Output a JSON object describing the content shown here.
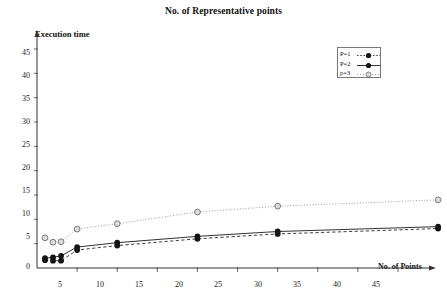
{
  "chart_data": {
    "type": "line",
    "title": "No. of Representative points",
    "xlabel": "No. of  Points",
    "ylabel": "Execution time",
    "xlim": [
      0,
      50
    ],
    "ylim": [
      0,
      47
    ],
    "xticks": [
      5,
      10,
      15,
      20,
      25,
      30,
      35,
      40,
      45
    ],
    "yticks": [
      0,
      5,
      10,
      15,
      20,
      25,
      30,
      35,
      40,
      45
    ],
    "grid": false,
    "legend_position": "upper-right",
    "series": [
      {
        "name": "P=1",
        "marker": "filled-circle",
        "linestyle": "solid",
        "color": "#1a1a1a",
        "x": [
          1,
          2,
          3,
          5,
          10,
          20,
          30,
          50
        ],
        "y": [
          2.0,
          2.2,
          2.5,
          4.3,
          5.2,
          6.5,
          7.5,
          8.5
        ]
      },
      {
        "name": "P=2",
        "marker": "filled-circle",
        "linestyle": "dashed",
        "color": "#1a1a1a",
        "x": [
          1,
          2,
          3,
          5,
          10,
          20,
          30,
          50
        ],
        "y": [
          1.6,
          1.5,
          1.5,
          3.7,
          4.6,
          6.0,
          7.0,
          8.1
        ]
      },
      {
        "name": "p=3",
        "marker": "open-circle",
        "linestyle": "dotted",
        "color": "#8a8a8a",
        "x": [
          1,
          2,
          3,
          5,
          10,
          20,
          30,
          50
        ],
        "y": [
          6.2,
          5.3,
          5.4,
          8.0,
          9.1,
          11.5,
          12.7,
          14.0
        ]
      }
    ]
  },
  "legend": {
    "entries": [
      {
        "label": "P=1"
      },
      {
        "label": "P=2"
      },
      {
        "label": "p=3"
      }
    ]
  },
  "ytick_labels": [
    "45",
    "40",
    "35",
    "30",
    "25",
    "20",
    "15",
    "10",
    "5",
    "0"
  ],
  "xtick_labels": [
    "5",
    "10",
    "15",
    "20",
    "25",
    "30",
    "35",
    "40",
    "45"
  ]
}
